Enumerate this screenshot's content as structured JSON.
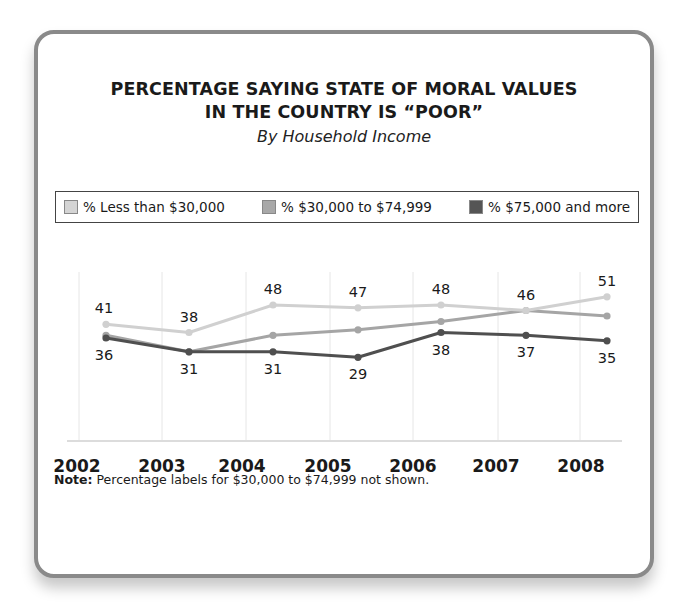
{
  "chart": {
    "title_lines": [
      "PERCENTAGE SAYING STATE OF MORAL VALUES",
      "IN THE COUNTRY IS “POOR”"
    ],
    "subtitle": "By Household Income",
    "legend": [
      {
        "label": "% Less than $30,000",
        "color": "#d4d4d4"
      },
      {
        "label": "% $30,000 to $74,999",
        "color": "#a8a8a8"
      },
      {
        "label": "% $75,000 and more",
        "color": "#555555"
      }
    ],
    "note_label": "Note:",
    "note_text": " Percentage labels for $30,000 to $74,999 not shown."
  },
  "chart_data": {
    "type": "line",
    "subtitle": "By Household Income",
    "xlabel": "",
    "ylabel": "",
    "x": [
      "2002",
      "2003",
      "2004",
      "2005",
      "2006",
      "2007",
      "2008"
    ],
    "series": [
      {
        "name": "% Less than $30,000",
        "color": "#d4d4d4",
        "values": [
          41,
          38,
          48,
          47,
          48,
          46,
          51
        ],
        "labels_shown": true
      },
      {
        "name": "% $30,000 to $74,999",
        "color": "#a8a8a8",
        "values": [
          37,
          31,
          37,
          39,
          42,
          46,
          44
        ],
        "labels_shown": false
      },
      {
        "name": "% $75,000 and more",
        "color": "#555555",
        "values": [
          36,
          31,
          31,
          29,
          38,
          37,
          35
        ],
        "labels_shown": true
      }
    ],
    "data_labels": {
      "top_series": [
        41,
        38,
        48,
        47,
        48,
        46,
        51
      ],
      "bottom_series": [
        36,
        31,
        31,
        29,
        38,
        37,
        35
      ]
    },
    "ylim": [
      0,
      60
    ],
    "grid": "vertical",
    "legend_position": "top",
    "note": "Note: Percentage labels for $30,000 to $74,999 not shown."
  }
}
